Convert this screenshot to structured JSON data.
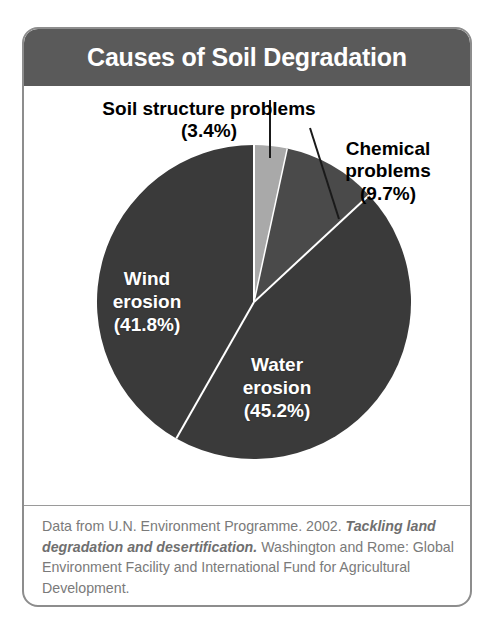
{
  "figure": {
    "title": "Causes of Soil Degradation",
    "card_border_color": "#8d8d8d",
    "title_bar_color": "#5a5a5a",
    "title_text_color": "#ffffff",
    "background_color": "#ffffff"
  },
  "chart_data": {
    "type": "pie",
    "title": "Causes of Soil Degradation",
    "xlabel": "",
    "ylabel": "",
    "grid": false,
    "legend_position": "none",
    "label_format": "name (value%)",
    "start_angle_deg": 0,
    "direction": "clockwise",
    "categories": [
      "Soil structure problems",
      "Chemical problems",
      "Water erosion",
      "Wind erosion"
    ],
    "values": [
      3.4,
      9.7,
      45.2,
      41.8
    ],
    "units": "percent",
    "total": 100.1,
    "colors": [
      "#a9a9a9",
      "#4a4a4a",
      "#3a3a3a",
      "#3a3a3a"
    ],
    "slices": [
      {
        "name": "Soil structure problems",
        "value": 3.4,
        "value_label": "(3.4%)",
        "color": "#a9a9a9",
        "label_placement": "outside-callout",
        "label_lines": [
          "Soil structure problems",
          "(3.4%)"
        ],
        "label_text_color": "#000000"
      },
      {
        "name": "Chemical problems",
        "value": 9.7,
        "value_label": "(9.7%)",
        "color": "#4a4a4a",
        "label_placement": "outside-callout",
        "label_lines": [
          "Chemical",
          "problems",
          "(9.7%)"
        ],
        "label_text_color": "#000000"
      },
      {
        "name": "Water erosion",
        "value": 45.2,
        "value_label": "(45.2%)",
        "color": "#3a3a3a",
        "label_placement": "inside",
        "label_lines": [
          "Water",
          "erosion",
          "(45.2%)"
        ],
        "label_text_color": "#ffffff"
      },
      {
        "name": "Wind erosion",
        "value": 41.8,
        "value_label": "(41.8%)",
        "color": "#3a3a3a",
        "label_placement": "inside",
        "label_lines": [
          "Wind",
          "erosion",
          "(41.8%)"
        ],
        "label_text_color": "#ffffff"
      }
    ],
    "geometry": {
      "center_x": 230,
      "center_y": 273,
      "radius": 157,
      "separator_color": "#ffffff",
      "separator_width": 2
    }
  },
  "labels": {
    "soil_structure": {
      "line1": "Soil structure problems",
      "line2": "(3.4%)"
    },
    "chemical": {
      "line1": "Chemical",
      "line2": "problems",
      "line3": "(9.7%)"
    },
    "wind": {
      "line1": "Wind",
      "line2": "erosion",
      "line3": "(41.8%)"
    },
    "water": {
      "line1": "Water",
      "line2": "erosion",
      "line3": "(45.2%)"
    }
  },
  "caption": {
    "part1": "Data from U.N. Environment Programme. 2002. ",
    "italic1": "Tackling land degradation and desertification.",
    "part2": " Washington and Rome: Global Environment Facility and International Fund for Agricultural Development.",
    "text_color": "#7a7a7a"
  }
}
